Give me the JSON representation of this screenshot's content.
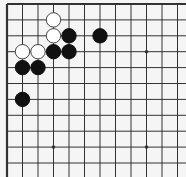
{
  "board": {
    "type": "go-board-fragment",
    "visible_columns": 12,
    "visible_rows": 11,
    "edges": [
      "top",
      "left"
    ],
    "colors": {
      "background": "#f5f5f5",
      "line": "#333333",
      "black": "#111111",
      "white": "#ffffff"
    },
    "star_points": [
      [
        3,
        9
      ],
      [
        9,
        9
      ],
      [
        9,
        3
      ]
    ],
    "stones": [
      {
        "color": "white",
        "col": 3,
        "row": 1
      },
      {
        "color": "white",
        "col": 3,
        "row": 2
      },
      {
        "color": "white",
        "col": 1,
        "row": 3
      },
      {
        "color": "white",
        "col": 2,
        "row": 3
      },
      {
        "color": "black",
        "col": 4,
        "row": 2
      },
      {
        "color": "black",
        "col": 6,
        "row": 2
      },
      {
        "color": "black",
        "col": 3,
        "row": 3
      },
      {
        "color": "black",
        "col": 4,
        "row": 3
      },
      {
        "color": "black",
        "col": 1,
        "row": 4
      },
      {
        "color": "black",
        "col": 2,
        "row": 4
      },
      {
        "color": "black",
        "col": 1,
        "row": 6
      }
    ]
  }
}
